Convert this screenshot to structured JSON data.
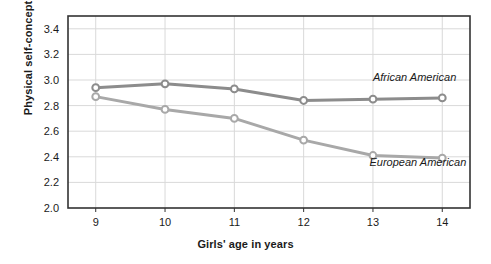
{
  "chart_data": {
    "type": "line",
    "title": "",
    "xlabel": "Girls' age in years",
    "ylabel": "Physical self-concept",
    "x": [
      9,
      10,
      11,
      12,
      13,
      14
    ],
    "xtick_labels": [
      "9",
      "10",
      "11",
      "12",
      "13",
      "14"
    ],
    "ytick_labels": [
      "2.0",
      "2.2",
      "2.4",
      "2.6",
      "2.8",
      "3.0",
      "3.2",
      "3.4"
    ],
    "yticks": [
      2.0,
      2.2,
      2.4,
      2.6,
      2.8,
      3.0,
      3.2,
      3.4
    ],
    "xlim": [
      8.6,
      14.4
    ],
    "ylim": [
      2.0,
      3.5
    ],
    "grid": "both",
    "legend_position": "inline-annotation",
    "series": [
      {
        "name": "African American",
        "values": [
          2.94,
          2.97,
          2.93,
          2.84,
          2.85,
          2.86
        ],
        "color": "#8c8c8c",
        "marker": "circle-open",
        "annotation": "African American",
        "annotation_x": 13.0,
        "annotation_y": 2.99
      },
      {
        "name": "European American",
        "values": [
          2.87,
          2.77,
          2.7,
          2.53,
          2.41,
          2.39
        ],
        "color": "#a8a8a8",
        "marker": "circle-open",
        "annotation": "European American",
        "annotation_x": 12.95,
        "annotation_y": 2.33
      }
    ],
    "colors": {
      "series_1": "#8c8c8c",
      "series_2": "#a8a8a8",
      "frame": "#333333",
      "gridline": "#d9d9d9",
      "marker_fill": "#ffffff",
      "background": "#ffffff",
      "text": "#1a1a1a"
    }
  }
}
